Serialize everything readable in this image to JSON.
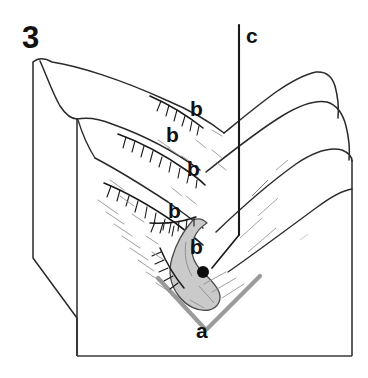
{
  "figure": {
    "number_label": "3",
    "type": "geomorphic block diagram",
    "background_color": "#ffffff",
    "line_color": "#1a1a1a",
    "accent_gray": "#9a9a9a",
    "deposit_fill": "#cccccc",
    "width": 368,
    "height": 378
  },
  "labels": {
    "figure_number": "3",
    "valley_axis": "a",
    "scarps": [
      {
        "id": "scarp-1",
        "text": "b"
      },
      {
        "id": "scarp-2",
        "text": "b"
      },
      {
        "id": "scarp-3",
        "text": "b"
      },
      {
        "id": "scarp-4",
        "text": "b"
      },
      {
        "id": "scarp-5",
        "text": "b"
      }
    ],
    "vertical_reference": "c"
  },
  "elements": {
    "block_name": "3d-terrain-block",
    "left_face_name": "block-left-face",
    "front_face_name": "block-front-face",
    "ridge_name": "ridge-spur",
    "deposit_name": "landslide-deposit-lobe",
    "source_point_name": "source-point-marker",
    "valley_axis_name": "valley-axis-chevron",
    "vertical_line_name": "vertical-reference-line"
  }
}
